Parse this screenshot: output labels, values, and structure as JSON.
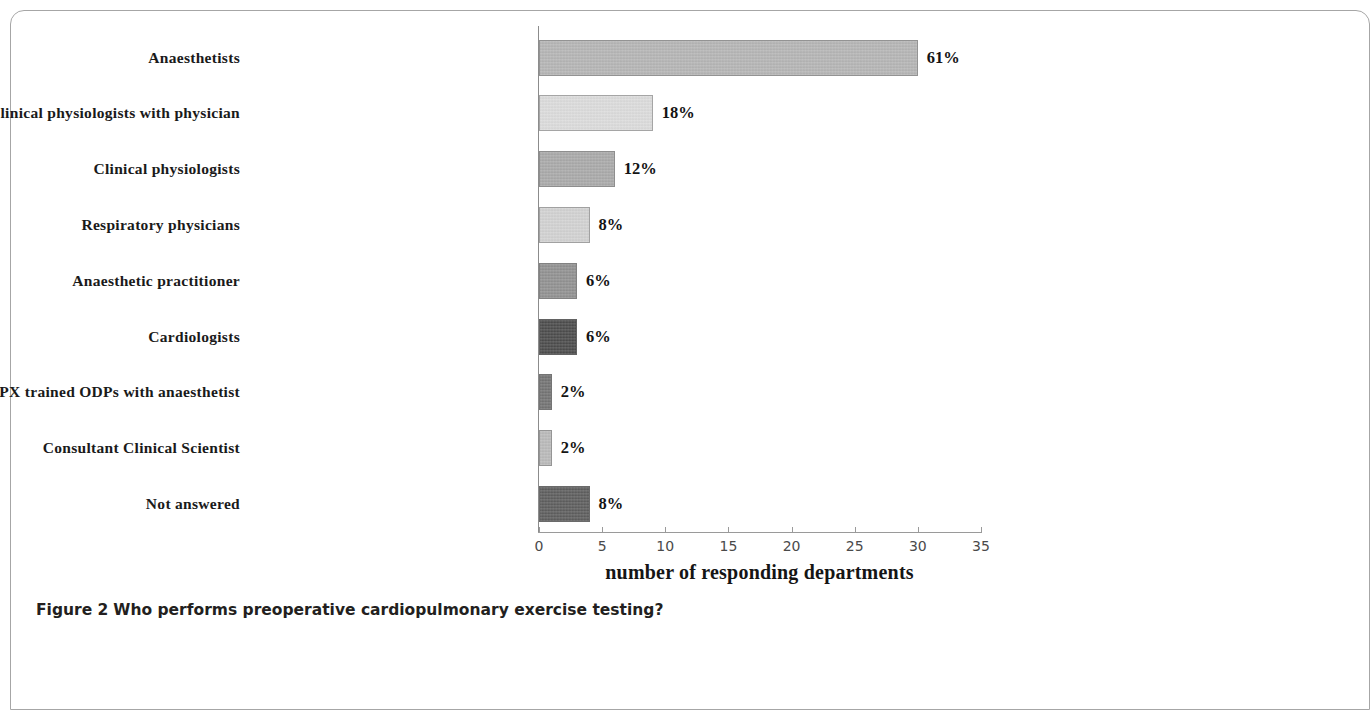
{
  "figure": {
    "caption_label": "Figure 2",
    "caption_text": "Who performs preoperative cardiopulmonary exercise testing?"
  },
  "chart_data": {
    "type": "bar",
    "orientation": "horizontal",
    "title": "",
    "xlabel": "number of responding departments",
    "ylabel": "",
    "xlim": [
      0,
      35
    ],
    "xticks": [
      0,
      5,
      10,
      15,
      20,
      25,
      30,
      35
    ],
    "grid": false,
    "legend": "none",
    "categories": [
      "Anaesthetists",
      "Clinical physiologists with physician",
      "Clinical physiologists",
      "Respiratory physicians",
      "Anaesthetic practitioner",
      "Cardiologists",
      "CPX trained ODPs with anaesthetist",
      "Consultant Clinical Scientist",
      "Not answered"
    ],
    "values": [
      30,
      9,
      6,
      4,
      3,
      3,
      1,
      1,
      4
    ],
    "data_labels": [
      "61%",
      "18%",
      "12%",
      "8%",
      "6%",
      "6%",
      "2%",
      "2%",
      "8%"
    ],
    "bar_colors": [
      "#b4b4b4",
      "#dcdcdc",
      "#a8a8a8",
      "#d2d2d2",
      "#8f8f8f",
      "#474747",
      "#707070",
      "#b9b9b9",
      "#5a5a5a"
    ]
  }
}
